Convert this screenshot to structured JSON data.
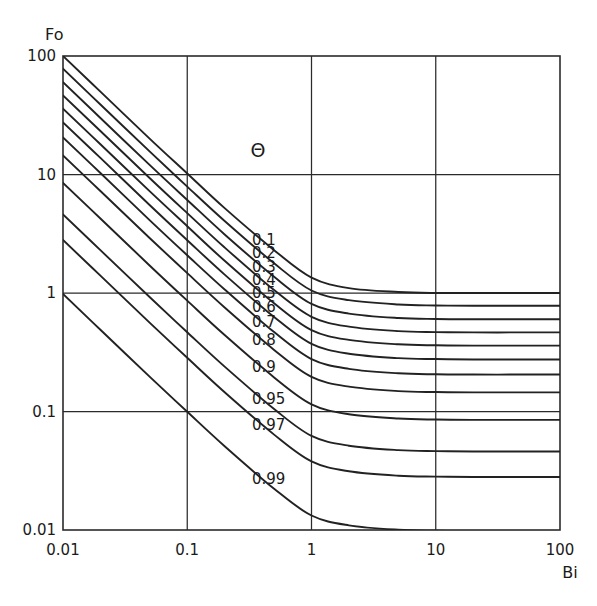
{
  "chart_data": {
    "type": "line",
    "title": "",
    "xlabel": "Bi",
    "ylabel": "Fo",
    "xscale": "log",
    "yscale": "log",
    "xlim": [
      0.01,
      100
    ],
    "ylim": [
      0.01,
      100
    ],
    "grid": true,
    "legend_position": "inline-labels",
    "legend_symbol": "Θ",
    "x_ticks": [
      "0.01",
      "0.1",
      "1",
      "10",
      "100"
    ],
    "y_ticks": [
      "0.01",
      "0.1",
      "1",
      "10",
      "100"
    ],
    "x_tick_values": [
      0.01,
      0.1,
      1,
      10,
      100
    ],
    "y_tick_values": [
      0.01,
      0.1,
      1,
      10,
      100
    ],
    "series": [
      {
        "name": "0.1",
        "label": "0.1",
        "asymptote_fo": 1.0,
        "x": [
          0.01,
          0.02,
          0.05,
          0.1,
          0.2,
          0.5,
          1,
          2,
          5,
          10,
          20,
          50,
          100
        ],
        "y": [
          100,
          50,
          20,
          10.2,
          5.2,
          2.3,
          1.35,
          1.1,
          1.02,
          1.0,
          1.0,
          1.0,
          1.0
        ]
      },
      {
        "name": "0.2",
        "label": "0.2",
        "asymptote_fo": 0.78,
        "x": [
          0.01,
          0.02,
          0.05,
          0.1,
          0.2,
          0.5,
          1,
          2,
          5,
          10,
          20,
          50,
          100
        ],
        "y": [
          78,
          39,
          15.6,
          7.9,
          4.05,
          1.78,
          1.05,
          0.87,
          0.8,
          0.785,
          0.78,
          0.78,
          0.78
        ]
      },
      {
        "name": "0.3",
        "label": "0.3",
        "asymptote_fo": 0.6,
        "x": [
          0.01,
          0.02,
          0.05,
          0.1,
          0.2,
          0.5,
          1,
          2,
          5,
          10,
          20,
          50,
          100
        ],
        "y": [
          60,
          30,
          12,
          6.1,
          3.12,
          1.37,
          0.81,
          0.67,
          0.615,
          0.603,
          0.6,
          0.6,
          0.6
        ]
      },
      {
        "name": "0.4",
        "label": "0.4",
        "asymptote_fo": 0.465,
        "x": [
          0.01,
          0.02,
          0.05,
          0.1,
          0.2,
          0.5,
          1,
          2,
          5,
          10,
          20,
          50,
          100
        ],
        "y": [
          46.5,
          23.3,
          9.3,
          4.72,
          2.42,
          1.06,
          0.63,
          0.52,
          0.477,
          0.468,
          0.465,
          0.465,
          0.465
        ]
      },
      {
        "name": "0.5",
        "label": "0.5",
        "asymptote_fo": 0.36,
        "x": [
          0.01,
          0.02,
          0.05,
          0.1,
          0.2,
          0.5,
          1,
          2,
          5,
          10,
          20,
          50,
          100
        ],
        "y": [
          36,
          18,
          7.2,
          3.66,
          1.87,
          0.82,
          0.487,
          0.402,
          0.369,
          0.362,
          0.36,
          0.36,
          0.36
        ]
      },
      {
        "name": "0.6",
        "label": "0.6",
        "asymptote_fo": 0.275,
        "x": [
          0.01,
          0.02,
          0.05,
          0.1,
          0.2,
          0.5,
          1,
          2,
          5,
          10,
          20,
          50,
          100
        ],
        "y": [
          27.5,
          13.8,
          5.5,
          2.79,
          1.43,
          0.627,
          0.372,
          0.307,
          0.282,
          0.277,
          0.275,
          0.275,
          0.275
        ]
      },
      {
        "name": "0.7",
        "label": "0.7",
        "asymptote_fo": 0.205,
        "x": [
          0.01,
          0.02,
          0.05,
          0.1,
          0.2,
          0.5,
          1,
          2,
          5,
          10,
          20,
          50,
          100
        ],
        "y": [
          20.5,
          10.3,
          4.1,
          2.08,
          1.07,
          0.468,
          0.277,
          0.229,
          0.21,
          0.206,
          0.205,
          0.205,
          0.205
        ]
      },
      {
        "name": "0.8",
        "label": "0.8",
        "asymptote_fo": 0.145,
        "x": [
          0.01,
          0.02,
          0.05,
          0.1,
          0.2,
          0.5,
          1,
          2,
          5,
          10,
          20,
          50,
          100
        ],
        "y": [
          14.5,
          7.25,
          2.9,
          1.47,
          0.755,
          0.331,
          0.196,
          0.162,
          0.1487,
          0.1459,
          0.145,
          0.145,
          0.145
        ]
      },
      {
        "name": "0.9",
        "label": "0.9",
        "asymptote_fo": 0.085,
        "x": [
          0.01,
          0.02,
          0.05,
          0.1,
          0.2,
          0.5,
          1,
          2,
          5,
          10,
          20,
          50,
          100
        ],
        "y": [
          8.5,
          4.25,
          1.7,
          0.862,
          0.442,
          0.194,
          0.115,
          0.0949,
          0.0872,
          0.0855,
          0.085,
          0.085,
          0.085
        ]
      },
      {
        "name": "0.95",
        "label": "0.95",
        "asymptote_fo": 0.046,
        "x": [
          0.01,
          0.02,
          0.05,
          0.1,
          0.2,
          0.5,
          1,
          2,
          5,
          10,
          20,
          50,
          100
        ],
        "y": [
          4.6,
          2.3,
          0.92,
          0.466,
          0.239,
          0.105,
          0.0622,
          0.0514,
          0.0472,
          0.0463,
          0.046,
          0.046,
          0.046
        ]
      },
      {
        "name": "0.97",
        "label": "0.97",
        "asymptote_fo": 0.028,
        "x": [
          0.01,
          0.02,
          0.05,
          0.1,
          0.2,
          0.5,
          1,
          2,
          5,
          10,
          20,
          50,
          100
        ],
        "y": [
          2.8,
          1.4,
          0.56,
          0.284,
          0.1455,
          0.0638,
          0.0379,
          0.0313,
          0.0287,
          0.0282,
          0.028,
          0.028,
          0.028
        ]
      },
      {
        "name": "0.99",
        "label": "0.99",
        "asymptote_fo": 0.0098,
        "x": [
          0.01,
          0.02,
          0.05,
          0.1,
          0.2,
          0.5,
          1,
          2,
          5,
          10,
          20,
          50,
          100
        ],
        "y": [
          0.98,
          0.49,
          0.196,
          0.0994,
          0.0509,
          0.0223,
          0.01325,
          0.01095,
          0.01005,
          0.00986,
          0.0098,
          0.0098,
          0.0098
        ]
      }
    ],
    "annotations": [
      {
        "text": "Θ",
        "role": "contour-variable-symbol"
      }
    ]
  },
  "axes": {
    "y_title": "Fo",
    "x_title": "Bi"
  }
}
